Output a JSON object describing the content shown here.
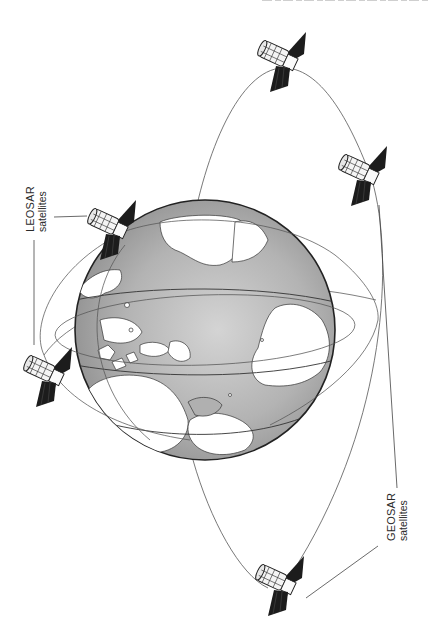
{
  "figure": {
    "type": "satellite system illustration"
  },
  "labels": {
    "leosar": {
      "line1": "LEOSAR",
      "line2": "satellites"
    },
    "geosar": {
      "line1": "GEOSAR",
      "line2": "satellites"
    }
  },
  "satellites": [
    {
      "name": "leosar-satellite-1",
      "group": "LEOSAR",
      "x": 108,
      "y": 228
    },
    {
      "name": "leosar-satellite-2",
      "group": "LEOSAR",
      "x": 48,
      "y": 380
    },
    {
      "name": "geosar-satellite-top",
      "group": "GEOSAR",
      "x": 278,
      "y": 62
    },
    {
      "name": "geosar-satellite-right",
      "group": "GEOSAR",
      "x": 360,
      "y": 177
    },
    {
      "name": "geosar-satellite-bottom",
      "group": "GEOSAR",
      "x": 276,
      "y": 592
    }
  ],
  "colors": {
    "ocean": "#a9a9a9",
    "land": "#ffffff",
    "outline": "#222222",
    "orbit": "#555555",
    "panel": "#1c1c1c"
  }
}
